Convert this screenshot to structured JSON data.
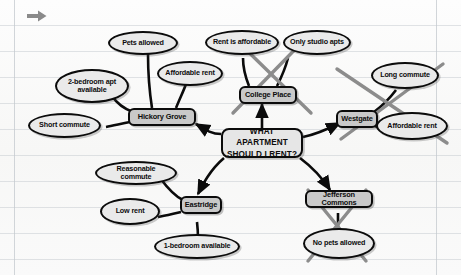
{
  "diagram": {
    "background": {
      "type": "ruled-paper",
      "line_color": "#c8cdd2",
      "paper_color": "#fafafa"
    },
    "colors": {
      "node_fill": "#c9c9c9",
      "center_fill": "#e6e6e6",
      "ellipse_fill": "#eaeaea",
      "outline": "#0b0b0b",
      "strike_through": "#8c8c8c",
      "cursor": "#8a8a8a"
    },
    "center": {
      "line1": "WHAT APARTMENT",
      "line2": "SHOULD I RENT?"
    },
    "cursor": {
      "icon": "arrow-right-icon"
    },
    "options": [
      {
        "id": "hickory-grove",
        "label": "Hickory Grove",
        "eliminated": false,
        "attributes": [
          {
            "id": "pets-allowed",
            "label": "Pets allowed",
            "eliminated": false
          },
          {
            "id": "two-bedroom-apt-available",
            "label": "2-bedroom apt available",
            "eliminated": false
          },
          {
            "id": "affordable-rent-hickory",
            "label": "Affordable rent",
            "eliminated": false
          },
          {
            "id": "short-commute",
            "label": "Short commute",
            "eliminated": false
          }
        ]
      },
      {
        "id": "college-place",
        "label": "College Place",
        "eliminated": true,
        "attributes": [
          {
            "id": "rent-is-affordable",
            "label": "Rent is affordable",
            "eliminated": true
          },
          {
            "id": "only-studio-apts",
            "label": "Only studio apts",
            "eliminated": true
          }
        ]
      },
      {
        "id": "westgate",
        "label": "Westgate",
        "eliminated": true,
        "attributes": [
          {
            "id": "long-commute",
            "label": "Long commute",
            "eliminated": true
          },
          {
            "id": "affordable-rent-westgate",
            "label": "Affordable rent",
            "eliminated": true
          }
        ]
      },
      {
        "id": "eastridge",
        "label": "Eastridge",
        "eliminated": false,
        "attributes": [
          {
            "id": "reasonable-commute",
            "label": "Reasonable commute",
            "eliminated": false
          },
          {
            "id": "low-rent",
            "label": "Low rent",
            "eliminated": false
          },
          {
            "id": "one-bedroom-available",
            "label": "1-bedroom available",
            "eliminated": false
          }
        ]
      },
      {
        "id": "jefferson-commons",
        "label": "Jefferson Commons",
        "eliminated": true,
        "attributes": [
          {
            "id": "no-pets-allowed",
            "label": "No pets allowed",
            "eliminated": true
          }
        ]
      }
    ]
  }
}
